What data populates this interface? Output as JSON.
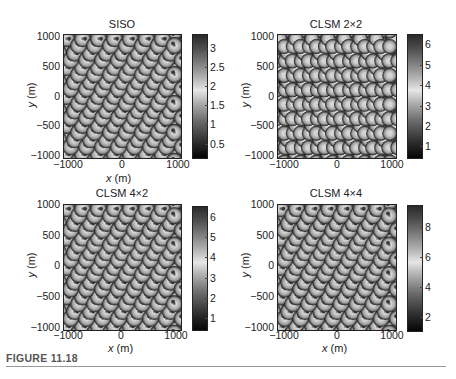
{
  "caption": "FIGURE 11.18",
  "chart_data": [
    {
      "type": "heatmap",
      "title": "SISO",
      "xlabel": "x (m)",
      "ylabel": "y (m)",
      "xlim": [
        -1100,
        1100
      ],
      "ylim": [
        -1050,
        1050
      ],
      "xticks": [
        "−1000",
        "0",
        "1000"
      ],
      "yticks": [
        "1000",
        "500",
        "0",
        "−500",
        "−1000"
      ],
      "colorbar": {
        "range": [
          0.1,
          3.3
        ],
        "ticks": [
          "3",
          "2.5",
          "2",
          "1.5",
          "1",
          "0.5"
        ]
      },
      "colormap": "dark-light-dark grayscale",
      "description": "Hexagonal cellular layout with three-sector patterns at each site; rate/capacity map"
    },
    {
      "type": "heatmap",
      "title": "CLSM 2×2",
      "xlabel": "x (m)",
      "ylabel": "y (m)",
      "xlim": [
        -1100,
        1100
      ],
      "ylim": [
        -1050,
        1050
      ],
      "xticks": [
        "−1000",
        "0",
        "1000"
      ],
      "yticks": [
        "1000",
        "500",
        "0",
        "−500",
        "−1000"
      ],
      "colorbar": {
        "range": [
          0.3,
          6.5
        ],
        "ticks": [
          "6",
          "5",
          "4",
          "3",
          "2",
          "1"
        ]
      },
      "colormap": "dark-light-dark grayscale",
      "description": "Hexagonal cellular layout, brighter cell areas with dark boundaries"
    },
    {
      "type": "heatmap",
      "title": "CLSM 4×2",
      "xlabel": "x (m)",
      "ylabel": "y (m)",
      "xlim": [
        -1100,
        1100
      ],
      "ylim": [
        -1050,
        1050
      ],
      "xticks": [
        "−1000",
        "0",
        "1000"
      ],
      "yticks": [
        "1000",
        "500",
        "0",
        "−500",
        "−1000"
      ],
      "colorbar": {
        "range": [
          0.4,
          6.6
        ],
        "ticks": [
          "6",
          "5",
          "4",
          "3",
          "2",
          "1"
        ]
      },
      "colormap": "dark-light-dark grayscale",
      "description": "Hexagonal cellular layout with three-sector patterns"
    },
    {
      "type": "heatmap",
      "title": "CLSM 4×4",
      "xlabel": "x (m)",
      "ylabel": "y (m)",
      "xlim": [
        -1100,
        1100
      ],
      "ylim": [
        -1050,
        1050
      ],
      "xticks": [
        "−1000",
        "0",
        "1000"
      ],
      "yticks": [
        "1000",
        "500",
        "0",
        "−500",
        "−1000"
      ],
      "colorbar": {
        "range": [
          1.0,
          9.3
        ],
        "ticks": [
          "8",
          "6",
          "4",
          "2"
        ]
      },
      "colormap": "dark-light-dark grayscale",
      "description": "Hexagonal cellular layout with three-sector patterns"
    }
  ],
  "panels": [
    {
      "title": "SISO",
      "xlabel_x": "x",
      "xlabel_unit": " (m)",
      "ylabel_y": "y",
      "ylabel_unit": " (m)",
      "xticks": [
        "−1000",
        "0",
        "1000"
      ],
      "yticks": [
        "1000",
        "500",
        "0",
        "−500",
        "−1000"
      ],
      "cticks": [
        "3",
        "2.5",
        "2",
        "1.5",
        "1",
        "0.5"
      ]
    },
    {
      "title": "CLSM 2×2",
      "xlabel_x": "x",
      "xlabel_unit": " (m)",
      "ylabel_y": "y",
      "ylabel_unit": " (m)",
      "xticks": [
        "−1000",
        "0",
        "1000"
      ],
      "yticks": [
        "1000",
        "500",
        "0",
        "−500",
        "−1000"
      ],
      "cticks": [
        "6",
        "5",
        "4",
        "3",
        "2",
        "1"
      ]
    },
    {
      "title": "CLSM 4×2",
      "xlabel_x": "x",
      "xlabel_unit": " (m)",
      "ylabel_y": "y",
      "ylabel_unit": " (m)",
      "xticks": [
        "−1000",
        "0",
        "1000"
      ],
      "yticks": [
        "1000",
        "500",
        "0",
        "−500",
        "−1000"
      ],
      "cticks": [
        "6",
        "5",
        "4",
        "3",
        "2",
        "1"
      ]
    },
    {
      "title": "CLSM 4×4",
      "xlabel_x": "x",
      "xlabel_unit": " (m)",
      "ylabel_y": "y",
      "ylabel_unit": " (m)",
      "xticks": [
        "−1000",
        "0",
        "1000"
      ],
      "yticks": [
        "1000",
        "500",
        "0",
        "−500",
        "−1000"
      ],
      "cticks": [
        "8",
        "6",
        "4",
        "2"
      ]
    }
  ]
}
